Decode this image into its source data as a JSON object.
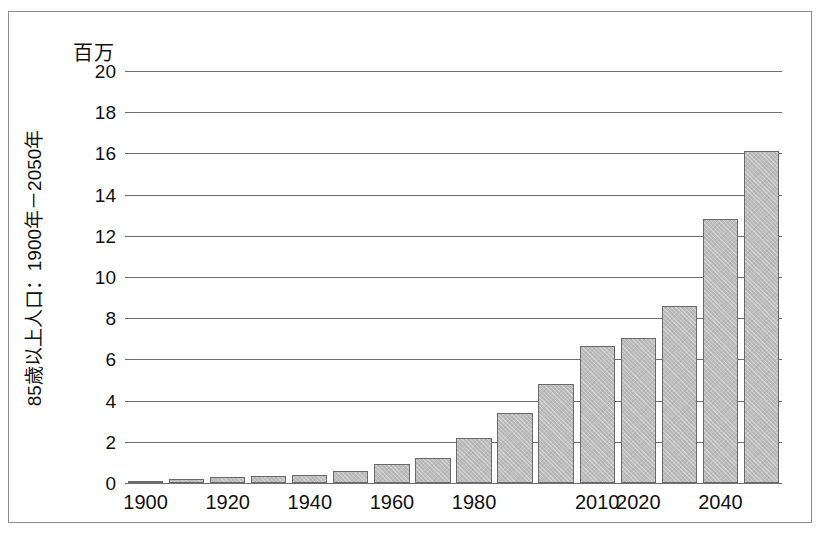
{
  "figure": {
    "units_title": "百万",
    "y_axis_label": "85歳以上人口：1900年－2050年",
    "border_color": "#8d8d8d",
    "bar_fill_color": "#bdbdbd",
    "bar_edge_color": "#6a6a6a",
    "gridline_color": "#6f6f6f"
  },
  "chart_data": {
    "type": "bar",
    "title": "百万",
    "subtitle": "",
    "xlabel": "",
    "ylabel": "85歳以上人口：1900年－2050年",
    "ylim": [
      0,
      20
    ],
    "yticks": [
      0,
      2,
      4,
      6,
      8,
      10,
      12,
      14,
      16,
      18,
      20
    ],
    "ytick_labels": [
      "0",
      "2",
      "4",
      "6",
      "8",
      "10",
      "12",
      "14",
      "16",
      "18",
      "20"
    ],
    "grid": true,
    "legend": false,
    "categories": [
      "1900",
      "1910",
      "1920",
      "1930",
      "1940",
      "1950",
      "1960",
      "1970",
      "1980",
      "1990",
      "2000",
      "2010",
      "2020",
      "2030",
      "2040",
      "2050"
    ],
    "visible_xtick_labels": [
      "1900",
      "1920",
      "1940",
      "1960",
      "1980",
      "2010",
      "2020",
      "2040"
    ],
    "visible_xtick_indices": [
      0,
      2,
      4,
      6,
      8,
      11,
      12,
      14
    ],
    "values": [
      0.12,
      0.21,
      0.27,
      0.32,
      0.37,
      0.58,
      0.93,
      1.2,
      2.2,
      3.4,
      4.8,
      6.65,
      7.05,
      8.6,
      12.8,
      16.1
    ]
  }
}
